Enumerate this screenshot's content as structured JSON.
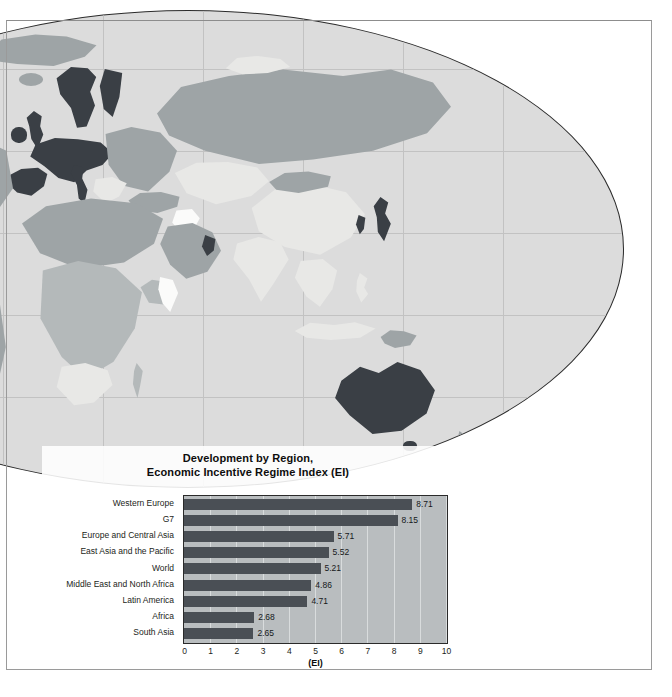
{
  "figure": {
    "map": {
      "name": "world-globe-orthographic",
      "description": "World map globe showing development shading by country",
      "ocean_color": "#dcdcdc",
      "outline_color": "#2b2b2b",
      "shade_levels": [
        "#3a3f45",
        "#9ea4a6",
        "#b4b9ba",
        "#e8e8e6",
        "#fbfbfa"
      ]
    },
    "chart_data": {
      "type": "bar",
      "orientation": "horizontal",
      "title": "Development by Region,\nEconomic Incentive Regime Index (EI)",
      "title_line1": "Development by Region,",
      "title_line2": "Economic Incentive Regime Index (EI)",
      "xlabel": "(EI)",
      "ylabel": "",
      "xlim": [
        0,
        10
      ],
      "xticks": [
        0,
        1,
        2,
        3,
        4,
        5,
        6,
        7,
        8,
        9,
        10
      ],
      "xtick_labels": [
        "0",
        "1",
        "2",
        "3",
        "4",
        "5",
        "6",
        "7",
        "8",
        "9",
        "10"
      ],
      "grid": true,
      "legend": false,
      "bar_color": "#4a4f55",
      "plot_bg_color": "#b9bdbf",
      "categories": [
        "Western Europe",
        "G7",
        "Europe and Central Asia",
        "East Asia and the Pacific",
        "World",
        "Middle East and North Africa",
        "Latin America",
        "Africa",
        "South Asia"
      ],
      "values": [
        8.71,
        8.15,
        5.71,
        5.52,
        5.21,
        4.86,
        4.71,
        2.68,
        2.65
      ],
      "value_labels": [
        "8.71",
        "8.15",
        "5.71",
        "5.52",
        "5.21",
        "4.86",
        "4.71",
        "2.68",
        "2.65"
      ]
    }
  }
}
